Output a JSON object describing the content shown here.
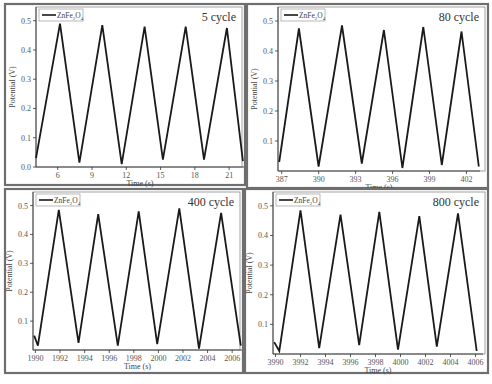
{
  "chart_data": [
    {
      "type": "line",
      "title": "5 cycle",
      "xlabel": "Time (s)",
      "ylabel": "Potential (V)",
      "legend": [
        "ZnFe2O4"
      ],
      "xlim": [
        4.1,
        22.3
      ],
      "ylim": [
        0.0,
        0.54
      ],
      "xticks": [
        6,
        9,
        12,
        15,
        18,
        21
      ],
      "yticks": [
        0.0,
        0.1,
        0.2,
        0.3,
        0.4,
        0.5
      ],
      "ytick_labels": [
        "0.0",
        "0.1",
        "0.2",
        "0.3",
        "0.4",
        "0.5"
      ],
      "series": [
        {
          "name": "ZnFe2O4",
          "x": [
            4.1,
            6.2,
            7.9,
            9.9,
            11.6,
            13.6,
            15.2,
            17.2,
            18.8,
            20.8,
            22.2
          ],
          "y": [
            0.03,
            0.49,
            0.015,
            0.485,
            0.01,
            0.48,
            0.025,
            0.48,
            0.025,
            0.475,
            0.02
          ]
        }
      ],
      "frame": {
        "x0": 5,
        "y0": 4,
        "x1": 245,
        "y1": 185
      },
      "plot": {
        "x0": 36,
        "y0": 6,
        "x1": 244,
        "y1": 167
      }
    },
    {
      "type": "line",
      "title": "80 cycle",
      "xlabel": "Time (s)",
      "ylabel": "Potential (V)",
      "legend": [
        "ZnFe2O4"
      ],
      "xlim": [
        386.7,
        403.1
      ],
      "ylim": [
        0.0,
        0.54
      ],
      "xticks": [
        387,
        390,
        393,
        396,
        399,
        402
      ],
      "yticks": [
        0.1,
        0.2,
        0.3,
        0.4,
        0.5
      ],
      "ytick_labels": [
        "0.1",
        "0.2",
        "0.3",
        "0.4",
        "0.5"
      ],
      "series": [
        {
          "name": "ZnFe2O4",
          "x": [
            386.8,
            388.4,
            390.0,
            391.9,
            393.5,
            395.3,
            396.8,
            398.5,
            400.0,
            401.6,
            403.0
          ],
          "y": [
            0.03,
            0.475,
            0.015,
            0.485,
            0.025,
            0.47,
            0.01,
            0.48,
            0.02,
            0.465,
            0.015
          ]
        }
      ],
      "frame": {
        "x0": 247,
        "y0": 4,
        "x1": 488,
        "y1": 188
      },
      "plot": {
        "x0": 278,
        "y0": 8,
        "x1": 480,
        "y1": 171
      }
    },
    {
      "type": "line",
      "title": "400 cycle",
      "xlabel": "Time (s)",
      "ylabel": "Potential (V)",
      "legend": [
        "ZnFe2O4"
      ],
      "xlim": [
        1989.8,
        2006.8
      ],
      "ylim": [
        0.0,
        0.54
      ],
      "xticks": [
        1990,
        1992,
        1994,
        1996,
        1998,
        2000,
        2002,
        2004,
        2006
      ],
      "yticks": [
        0.1,
        0.2,
        0.3,
        0.4,
        0.5
      ],
      "ytick_labels": [
        "0.1",
        "0.2",
        "0.3",
        "0.4",
        "0.5"
      ],
      "series": [
        {
          "name": "ZnFe2O4",
          "x": [
            1989.9,
            1990.2,
            1991.9,
            1993.5,
            1995.1,
            1996.7,
            1998.4,
            1999.9,
            2001.7,
            2003.3,
            2005.1,
            2006.7
          ],
          "y": [
            0.05,
            0.015,
            0.485,
            0.025,
            0.47,
            0.015,
            0.48,
            0.02,
            0.49,
            0.005,
            0.475,
            0.015
          ]
        }
      ],
      "frame": {
        "x0": 5,
        "y0": 189,
        "x1": 243,
        "y1": 373
      },
      "plot": {
        "x0": 33,
        "y0": 195,
        "x1": 242,
        "y1": 350
      }
    },
    {
      "type": "line",
      "title": "800 cycle",
      "xlabel": "Time (s)",
      "ylabel": "Potential (V)",
      "legend": [
        "ZnFe2O4"
      ],
      "xlim": [
        3989.8,
        4006.6
      ],
      "ylim": [
        0.0,
        0.54
      ],
      "xticks": [
        3990,
        3992,
        3994,
        3996,
        3998,
        4000,
        4002,
        4004,
        4006
      ],
      "yticks": [
        0.1,
        0.2,
        0.3,
        0.4,
        0.5
      ],
      "ytick_labels": [
        "0.1",
        "0.2",
        "0.3",
        "0.4",
        "0.5"
      ],
      "series": [
        {
          "name": "ZnFe2O4",
          "x": [
            3989.9,
            3990.3,
            3992.0,
            3993.5,
            3995.2,
            3996.7,
            3998.3,
            3999.8,
            4001.5,
            4002.9,
            4004.6,
            4006.1
          ],
          "y": [
            0.04,
            0.01,
            0.485,
            0.02,
            0.47,
            0.03,
            0.48,
            0.015,
            0.465,
            0.025,
            0.475,
            0.01
          ]
        }
      ],
      "frame": {
        "x0": 245,
        "y0": 189,
        "x1": 488,
        "y1": 373
      },
      "plot": {
        "x0": 273,
        "y0": 195,
        "x1": 483,
        "y1": 354
      }
    }
  ],
  "legend_label": "ZnFe",
  "legend_sub2": "2",
  "legend_o": "O",
  "legend_sub4": "4"
}
